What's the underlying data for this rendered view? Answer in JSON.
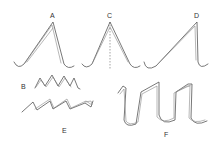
{
  "figure": {
    "panels": [
      {
        "id": "A",
        "label": "A",
        "description": "Symmetric inverted-V stroke with hooked ends, double line"
      },
      {
        "id": "B",
        "label": "B",
        "description": "Small zigzag stroke with overlapping peaks"
      },
      {
        "id": "C",
        "label": "C",
        "description": "Inverted-V stroke with dashed vertical center line"
      },
      {
        "id": "D",
        "label": "D",
        "description": "Asymmetric inverted-V stroke with long left leg and hooked ends"
      },
      {
        "id": "E",
        "label": "E",
        "description": "Sawtooth wave stroke drawn with double line"
      },
      {
        "id": "F",
        "label": "F",
        "description": "Square-wave ribbon stroke with curved bottoms"
      }
    ],
    "colors": {
      "stroke": "#555555",
      "background": "#ffffff"
    }
  }
}
